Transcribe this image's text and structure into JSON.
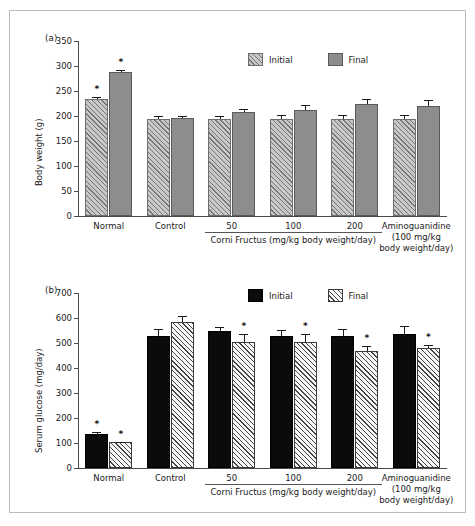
{
  "figure": {
    "panel_a_tag": "(a)",
    "panel_b_tag": "(b)"
  },
  "chart_data": [
    {
      "type": "bar",
      "panel": "(a)",
      "title": "",
      "xlabel": "",
      "ylabel": "Body weight (g)",
      "ylim": [
        0,
        350
      ],
      "yticks": [
        0,
        50,
        100,
        150,
        200,
        250,
        300,
        350
      ],
      "grid": false,
      "legend_position": "top-right",
      "categories": [
        "Normal",
        "Control",
        "50",
        "100",
        "200",
        "Aminoguanidine"
      ],
      "group_bracket_label": "Corni Fructus (mg/kg body weight/day)",
      "last_category_sub": "(100 mg/kg body weight/day)",
      "series": [
        {
          "name": "Initial",
          "style": "gray-hatch",
          "values": [
            235,
            194,
            194,
            194,
            194,
            194
          ],
          "errors": [
            3,
            7,
            7,
            8,
            8,
            9
          ],
          "significant": [
            true,
            false,
            false,
            false,
            false,
            false
          ]
        },
        {
          "name": "Final",
          "style": "gray-solid",
          "values": [
            288,
            196,
            209,
            213,
            224,
            221
          ],
          "errors": [
            5,
            4,
            6,
            10,
            10,
            12
          ],
          "significant": [
            true,
            false,
            false,
            false,
            false,
            false
          ]
        }
      ]
    },
    {
      "type": "bar",
      "panel": "(b)",
      "title": "",
      "xlabel": "",
      "ylabel": "Serum glucose (mg/day)",
      "ylim": [
        0,
        700
      ],
      "yticks": [
        0,
        100,
        200,
        300,
        400,
        500,
        600,
        700
      ],
      "grid": false,
      "legend_position": "top-right",
      "categories": [
        "Normal",
        "Control",
        "50",
        "100",
        "200",
        "Aminoguanidine"
      ],
      "group_bracket_label": "Corni Fructus (mg/kg body weight/day)",
      "last_category_sub": "(100 mg/kg body weight/day)",
      "series": [
        {
          "name": "Initial",
          "style": "black-solid",
          "values": [
            138,
            530,
            548,
            530,
            530,
            535
          ],
          "errors": [
            5,
            25,
            18,
            22,
            25,
            35
          ],
          "significant": [
            true,
            false,
            false,
            false,
            false,
            false
          ]
        },
        {
          "name": "Final",
          "style": "white-hatch",
          "values": [
            103,
            583,
            505,
            505,
            467,
            480
          ],
          "errors": [
            3,
            27,
            33,
            30,
            20,
            12
          ],
          "significant": [
            true,
            false,
            true,
            true,
            true,
            true
          ]
        }
      ]
    }
  ],
  "panel_a": {
    "tag": "(a)",
    "ylabel": "Body weight (g)",
    "yticks": [
      "350",
      "300",
      "250",
      "200",
      "150",
      "100",
      "50",
      "0"
    ],
    "legend": [
      {
        "label": "Initial",
        "style": "gray-hatch"
      },
      {
        "label": "Final",
        "style": "gray-solid"
      }
    ],
    "xlabels": [
      "Normal",
      "Control",
      "50",
      "100",
      "200",
      "Aminoguanidine"
    ],
    "bracket_label": "Corni Fructus (mg/kg body weight/day)",
    "amino_sub1": "(100 mg/kg",
    "amino_sub2": "body weight/day)",
    "star": "*"
  },
  "panel_b": {
    "tag": "(b)",
    "ylabel": "Serum glucose (mg/day)",
    "yticks": [
      "700",
      "600",
      "500",
      "400",
      "300",
      "200",
      "100",
      "0"
    ],
    "legend": [
      {
        "label": "Initial",
        "style": "black-solid"
      },
      {
        "label": "Final",
        "style": "white-hatch"
      }
    ],
    "xlabels": [
      "Normal",
      "Control",
      "50",
      "100",
      "200",
      "Aminoguanidine"
    ],
    "bracket_label": "Corni Fructus (mg/kg body weight/day)",
    "amino_sub1": "(100 mg/kg",
    "amino_sub2": "body weight/day)",
    "star": "*"
  },
  "colors": {
    "gray_hatch_fill": "#c8c8c8",
    "gray_solid_fill": "#8d8d8d",
    "black_fill": "#0b0b0b",
    "white_hatch_fill": "#f7f7f7",
    "axis": "#4a4a4a",
    "frame": "#bdbdbd"
  }
}
